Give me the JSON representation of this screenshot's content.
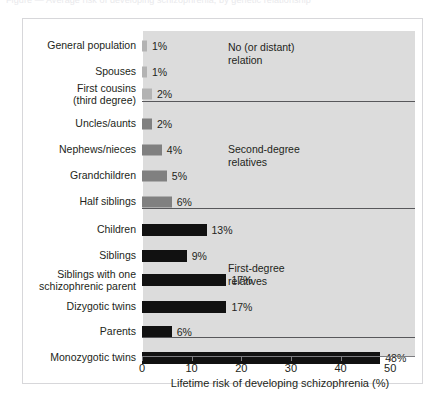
{
  "top_caption": "Figure — Average risk of developing schizophrenia, by genetic relationship",
  "chart_data": {
    "type": "bar",
    "orientation": "horizontal",
    "title": "",
    "xlabel": "Lifetime risk of developing schizophrenia (%)",
    "ylabel": "",
    "xlim": [
      0,
      55
    ],
    "xticks": [
      0,
      10,
      20,
      30,
      40,
      50
    ],
    "xtick_labels": [
      "0",
      "10",
      "20",
      "30",
      "40",
      "50"
    ],
    "grid": false,
    "legend": "none",
    "value_suffix": "%",
    "categories": [
      "General population",
      "Spouses",
      "First cousins (third degree)",
      "Uncles/aunts",
      "Nephews/nieces",
      "Grandchildren",
      "Half siblings",
      "Children",
      "Siblings",
      "Siblings with one schizophrenic parent",
      "Dizygotic twins",
      "Parents",
      "Monozygotic twins"
    ],
    "values": [
      1,
      1,
      2,
      2,
      4,
      5,
      6,
      13,
      9,
      17,
      17,
      6,
      48
    ],
    "value_labels": [
      "1%",
      "1%",
      "2%",
      "2%",
      "4%",
      "5%",
      "6%",
      "13%",
      "9%",
      "17%",
      "17%",
      "6%",
      "48%"
    ],
    "groups": [
      {
        "name": "No (or distant) relation",
        "label_line1": "No (or distant)",
        "label_line2": "relation",
        "members": [
          "General population",
          "Spouses",
          "First cousins (third degree)"
        ],
        "color": "#b3b3b3"
      },
      {
        "name": "Second-degree relatives",
        "label_line1": "Second-degree",
        "label_line2": "relatives",
        "members": [
          "Uncles/aunts",
          "Nephews/nieces",
          "Grandchildren",
          "Half siblings"
        ],
        "color": "#808080"
      },
      {
        "name": "First-degree relatives",
        "label_line1": "First-degree",
        "label_line2": "relatives",
        "members": [
          "Children",
          "Siblings",
          "Siblings with one schizophrenic parent",
          "Dizygotic twins",
          "Parents"
        ],
        "color": "#111111"
      },
      {
        "name": "Identical twins",
        "label_line1": "",
        "label_line2": "",
        "members": [
          "Monozygotic twins"
        ],
        "color": "#111111"
      }
    ]
  },
  "rows": [
    {
      "label1": "General population",
      "label2": "",
      "value": 1,
      "value_label": "1%",
      "color": "#b3b3b3"
    },
    {
      "label1": "Spouses",
      "label2": "",
      "value": 1,
      "value_label": "1%",
      "color": "#b3b3b3"
    },
    {
      "label1": "First cousins",
      "label2": "(third degree)",
      "value": 2,
      "value_label": "2%",
      "color": "#b3b3b3"
    },
    {
      "label1": "Uncles/aunts",
      "label2": "",
      "value": 2,
      "value_label": "2%",
      "color": "#808080"
    },
    {
      "label1": "Nephews/nieces",
      "label2": "",
      "value": 4,
      "value_label": "4%",
      "color": "#808080"
    },
    {
      "label1": "Grandchildren",
      "label2": "",
      "value": 5,
      "value_label": "5%",
      "color": "#808080"
    },
    {
      "label1": "Half siblings",
      "label2": "",
      "value": 6,
      "value_label": "6%",
      "color": "#808080"
    },
    {
      "label1": "Children",
      "label2": "",
      "value": 13,
      "value_label": "13%",
      "color": "#111111"
    },
    {
      "label1": "Siblings",
      "label2": "",
      "value": 9,
      "value_label": "9%",
      "color": "#111111"
    },
    {
      "label1": "Siblings with one",
      "label2": "schizophrenic parent",
      "value": 17,
      "value_label": "17%",
      "color": "#111111"
    },
    {
      "label1": "Dizygotic twins",
      "label2": "",
      "value": 17,
      "value_label": "17%",
      "color": "#111111"
    },
    {
      "label1": "Parents",
      "label2": "",
      "value": 6,
      "value_label": "6%",
      "color": "#111111"
    },
    {
      "label1": "Monozygotic twins",
      "label2": "",
      "value": 48,
      "value_label": "48%",
      "color": "#111111"
    }
  ],
  "axis": {
    "ticks": [
      "0",
      "10",
      "20",
      "30",
      "40",
      "50"
    ],
    "xlabel": "Lifetime risk of developing schizophrenia (%)"
  },
  "group_notes": [
    {
      "line1": "No (or distant)",
      "line2": "relation"
    },
    {
      "line1": "Second-degree",
      "line2": "relatives"
    },
    {
      "line1": "First-degree",
      "line2": "relatives"
    }
  ],
  "colors": {
    "panel": "#dcdcdc",
    "light_bar": "#b3b3b3",
    "mid_bar": "#808080",
    "dark_bar": "#111111",
    "axis": "#7c7c80",
    "separator": "#58585b",
    "text": "#231f20",
    "border": "#d7d7da"
  }
}
